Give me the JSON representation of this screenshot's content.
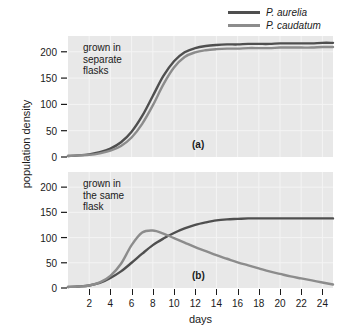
{
  "figure": {
    "background_color": "#ffffff",
    "plot_background_color": "#e8e8e8",
    "grid_color": "#f4f4f4",
    "axis_color": "#1a1a1a",
    "xlabel": "days",
    "ylabel": "population density"
  },
  "legend": {
    "position": "top-right",
    "entries": [
      {
        "label": "P. aurelia",
        "color": "#4f4f4f"
      },
      {
        "label": "P. caudatum",
        "color": "#8c8c8c"
      }
    ]
  },
  "panels": [
    {
      "tag": "(a)",
      "note": "grown in\nseparate\nflasks",
      "yticks": [
        "200",
        "150",
        "100",
        "50",
        "0"
      ]
    },
    {
      "tag": "(b)",
      "note": "grown in\nthe same\nflask",
      "yticks": [
        "200",
        "150",
        "100",
        "50",
        "0"
      ]
    }
  ],
  "xticks": [
    "2",
    "4",
    "6",
    "8",
    "10",
    "12",
    "14",
    "16",
    "18",
    "20",
    "22",
    "24"
  ],
  "chart_data": {
    "type": "line",
    "title": "",
    "xlabel": "days",
    "ylabel": "population density",
    "xlim": [
      0,
      25
    ],
    "ylim": [
      0,
      230
    ],
    "grid": true,
    "legend_position": "top-right",
    "panels": [
      {
        "tag": "(a)",
        "annotation": "grown in separate flasks",
        "yticks": [
          0,
          50,
          100,
          150,
          200
        ],
        "xticks": [
          2,
          4,
          6,
          8,
          10,
          12,
          14,
          16,
          18,
          20,
          22,
          24
        ],
        "x": [
          0,
          1,
          2,
          3,
          4,
          5,
          6,
          7,
          8,
          9,
          10,
          11,
          12,
          13,
          14,
          15,
          16,
          17,
          18,
          19,
          20,
          21,
          22,
          23,
          24,
          25
        ],
        "series": [
          {
            "name": "P. aurelia",
            "color": "#4f4f4f",
            "values": [
              2,
              3,
              5,
              9,
              16,
              28,
              48,
              78,
              116,
              154,
              182,
              199,
              207,
              211,
              213,
              214,
              214,
              215,
              215,
              215,
              216,
              216,
              216,
              216,
              217,
              217
            ]
          },
          {
            "name": "P. caudatum",
            "color": "#8c8c8c",
            "values": [
              2,
              3,
              4,
              7,
              12,
              21,
              37,
              63,
              98,
              138,
              170,
              190,
              199,
              203,
              205,
              206,
              206,
              207,
              207,
              207,
              208,
              208,
              208,
              208,
              209,
              209
            ]
          }
        ]
      },
      {
        "tag": "(b)",
        "annotation": "grown in the same flask",
        "yticks": [
          0,
          50,
          100,
          150,
          200
        ],
        "xticks": [
          2,
          4,
          6,
          8,
          10,
          12,
          14,
          16,
          18,
          20,
          22,
          24
        ],
        "x": [
          0,
          1,
          2,
          3,
          4,
          5,
          6,
          7,
          8,
          9,
          10,
          11,
          12,
          13,
          14,
          15,
          16,
          17,
          18,
          19,
          20,
          21,
          22,
          23,
          24,
          25
        ],
        "series": [
          {
            "name": "P. aurelia",
            "color": "#4f4f4f",
            "values": [
              2,
              3,
              5,
              10,
              20,
              33,
              50,
              68,
              85,
              98,
              109,
              118,
              125,
              130,
              134,
              136,
              137,
              138,
              138,
              138,
              138,
              138,
              138,
              138,
              138,
              138
            ]
          },
          {
            "name": "P. caudatum",
            "color": "#8c8c8c",
            "values": [
              2,
              3,
              5,
              11,
              24,
              48,
              85,
              110,
              114,
              108,
              99,
              90,
              81,
              73,
              65,
              58,
              51,
              45,
              39,
              33,
              28,
              23,
              19,
              15,
              11,
              7
            ]
          }
        ]
      }
    ]
  }
}
